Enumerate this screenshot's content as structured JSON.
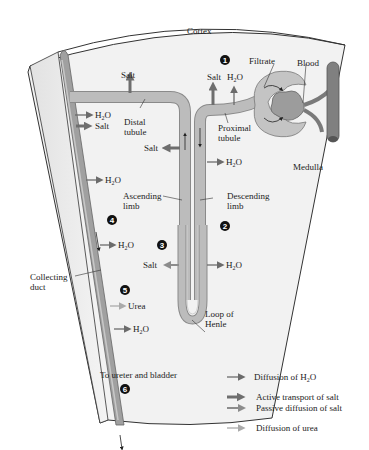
{
  "regions": {
    "cortex": "Cortex",
    "medulla": "Medulla"
  },
  "structures": {
    "filtrate": "Filtrate",
    "blood": "Blood",
    "proximal_tubule": [
      "Proximal",
      "tubule"
    ],
    "distal_tubule": [
      "Distal",
      "tubule"
    ],
    "ascending_limb": [
      "Ascending",
      "limb"
    ],
    "descending_limb": [
      "Descending",
      "limb"
    ],
    "loop_of_henle": [
      "Loop of",
      "Henle"
    ],
    "collecting_duct": [
      "Collecting",
      "duct"
    ],
    "outlet": "To ureter and bladder"
  },
  "step_numbers": [
    "1",
    "2",
    "3",
    "4",
    "5",
    "6"
  ],
  "substances": {
    "salt": "Salt",
    "water_main": "H",
    "water_sub": "2",
    "water_tail": "O",
    "urea": "Urea"
  },
  "transport_labels": {
    "proximal_salt": "Salt",
    "distal_salt": "Salt",
    "ascending_upper_salt": "Salt",
    "ascending_lower_salt": "Salt",
    "collecting_top_salt": "Salt",
    "urea": "Urea"
  },
  "legend": {
    "items": [
      {
        "label_pre": "Diffusion of H",
        "label_sub": "2",
        "label_post": "O",
        "arrow": "thin-dark"
      },
      {
        "label_pre": "Active transport of salt",
        "label_sub": "",
        "label_post": "",
        "arrow": "thick-dark"
      },
      {
        "label_pre": "Passive diffusion of salt",
        "label_sub": "",
        "label_post": "",
        "arrow": "medium-gray"
      },
      {
        "label_pre": "Diffusion of urea",
        "label_sub": "",
        "label_post": "",
        "arrow": "thin-light"
      }
    ]
  },
  "colors": {
    "tissue_fill": "#f1f1f1",
    "tissue_outline": "#333333",
    "tubule_fill": "#b9b9b9",
    "tubule_edge": "#8a8a8a",
    "collecting_duct_fill": "#9a9a9a",
    "blood_vessel": "#7a7a7a",
    "arrow_dark": "#6b6b6b",
    "arrow_active": "#6e6e6e",
    "arrow_passive": "#8c8c8c",
    "arrow_urea": "#aaaaaa"
  }
}
